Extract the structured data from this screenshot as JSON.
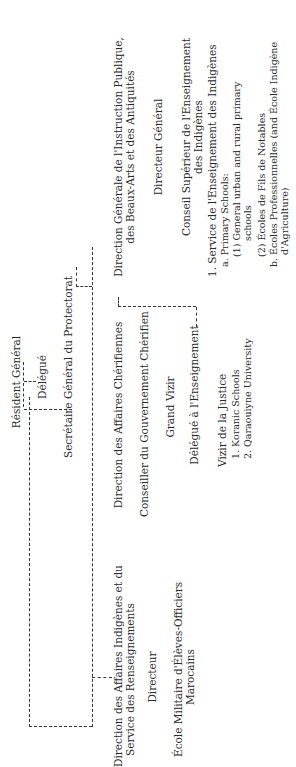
{
  "chart": {
    "orientation": "rotated-90-ccw",
    "top": {
      "resident": "Résident Général",
      "delegue": "Délégué",
      "secretaire": "Secrétaire Général du Protectorat"
    },
    "left_branch": {
      "direction_line1": "Direction des Affaires Indigènes et du",
      "direction_line2": "Service des Renseignements",
      "directeur": "Directeur",
      "ecole_line1": "École Militaire d'Élèves-Officiers",
      "ecole_line2": "Marocains"
    },
    "middle_branch": {
      "direction": "Direction des Affaires Chérifiennes",
      "conseiller": "Conseiller du Gouvernement Chérifien",
      "grand_vizir": "Grand Vizir",
      "delegue_ens": "Délégué à l'Enseignement",
      "vizir_justice": "Vizir de la Justice",
      "items": [
        "1. Koranic Schools",
        "2. Qaraouiyne University"
      ]
    },
    "right_branch": {
      "direction_line1": "Direction Générale de l'Instruction Publique,",
      "direction_line2": "des Beaux-Arts et des Antiquités",
      "directeur_general": "Directeur Général",
      "conseil_line1": "Conseil Supérieur de l'Enseignement",
      "conseil_line2": "des Indigènes",
      "service": "1. Service de l'Enseignement des Indigènes",
      "a": "a. Primary Schools:",
      "a1_line1": "(1) General urban and rural primary",
      "a1_line2": "schools",
      "a2": "(2) Écoles de Fils de Notables",
      "b_line1": "b. Écoles Professionnelles (and École Indigène",
      "b_line2": "d'Agriculture)"
    }
  }
}
